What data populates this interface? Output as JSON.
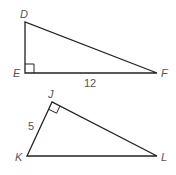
{
  "diagram": {
    "type": "right-triangles",
    "stroke_color": "#222222",
    "label_color": "#555555",
    "triangles": [
      {
        "name": "DEF",
        "vertices": {
          "D": {
            "label": "D",
            "x": 25,
            "y": 22
          },
          "E": {
            "label": "E",
            "x": 25,
            "y": 73
          },
          "F": {
            "label": "F",
            "x": 157,
            "y": 73
          }
        },
        "right_angle_at": "E",
        "side_labels": [
          {
            "side": "EF",
            "text": "12"
          }
        ]
      },
      {
        "name": "JKL",
        "vertices": {
          "J": {
            "label": "J",
            "x": 52,
            "y": 102
          },
          "K": {
            "label": "K",
            "x": 27,
            "y": 156
          },
          "L": {
            "label": "L",
            "x": 157,
            "y": 156
          }
        },
        "right_angle_at": "J",
        "side_labels": [
          {
            "side": "JK",
            "text": "5"
          }
        ]
      }
    ]
  }
}
